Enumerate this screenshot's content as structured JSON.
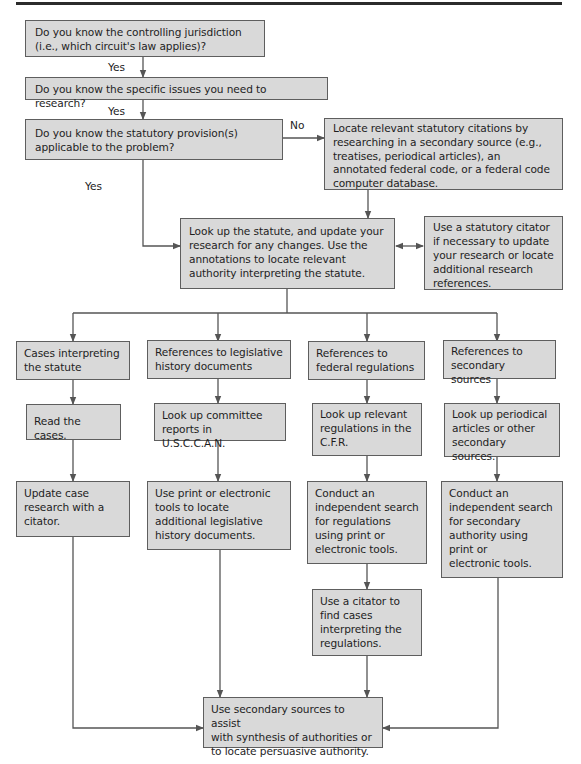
{
  "flowchart": {
    "nodes": {
      "q_jurisdiction": "Do you know the controlling jurisdiction\n(i.e., which circuit's law applies)?",
      "q_issues": "Do you know the specific issues you need to research?",
      "q_statute": "Do you know the statutory provision(s)\napplicable to the problem?",
      "locate_citations": "Locate relevant statutory citations by\nresearching in a secondary source (e.g.,\ntreatises, periodical articles), an\nannotated federal code, or a federal code\ncomputer database.",
      "lookup_statute": "Look up the statute, and update your\nresearch for any changes. Use the\nannotations to locate relevant\nauthority interpreting the statute.",
      "statutory_citator": "Use a statutory citator\nif necessary to update\nyour research or locate\nadditional research\nreferences.",
      "cases_interpreting": "Cases interpreting\nthe statute",
      "legislative_history": "References to legislative\nhistory documents",
      "federal_regulations": "References to\nfederal regulations",
      "secondary_sources": "References to\nsecondary sources",
      "read_cases": "Read the cases.",
      "committee_reports": "Look up committee\nreports in U.S.C.C.A.N.",
      "lookup_regulations": "Look up relevant\nregulations in the\nC.F.R.",
      "lookup_periodicals": "Look up periodical\narticles or other\nsecondary sources.",
      "update_case_research": "Update case\nresearch with a\ncitator.",
      "print_electronic_legislative": "Use print or electronic\ntools to locate\nadditional legislative\nhistory documents.",
      "search_regulations": "Conduct an\nindependent search\nfor regulations\nusing print or\nelectronic tools.",
      "search_secondary": "Conduct an\nindependent search\nfor secondary\nauthority using\nprint or\nelectronic tools.",
      "citator_regulations": "Use a citator to\nfind cases\ninterpreting the\nregulations.",
      "synthesis": "Use secondary sources to assist\nwith synthesis of authorities or\nto locate persuasive authority."
    },
    "labels": {
      "yes_1": "Yes",
      "yes_2": "Yes",
      "yes_3": "Yes",
      "no_1": "No"
    },
    "colors": {
      "box_fill": "#d9d9d9",
      "box_border": "#5e5e5e",
      "line": "#555555"
    }
  }
}
